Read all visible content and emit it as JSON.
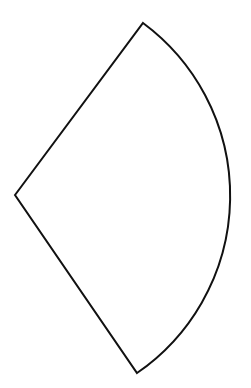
{
  "figure": {
    "shape": "circular-sector",
    "stroke_color": "#111111",
    "fill_color": "none",
    "background": "#ffffff",
    "stroke_width": 2,
    "center": [
      15,
      195
    ],
    "radius": 215,
    "vertices": {
      "apex": [
        15,
        195
      ],
      "top": [
        143,
        23
      ],
      "bottom": [
        137,
        373
      ]
    }
  }
}
